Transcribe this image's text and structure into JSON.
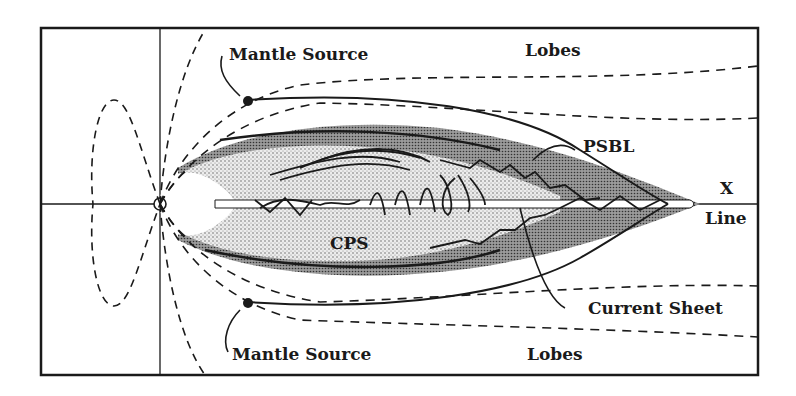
{
  "diagram": {
    "type": "magnetotail-schematic",
    "labels": {
      "mantle_source_top": "Mantle Source",
      "mantle_source_bottom": "Mantle Source",
      "lobes_top": "Lobes",
      "lobes_bottom": "Lobes",
      "psbl": "PSBL",
      "cps": "CPS",
      "x": "X",
      "line": "Line",
      "current_sheet": "Current Sheet"
    },
    "colors": {
      "ink": "#1a1a1a",
      "background": "#ffffff",
      "psbl_fill": "#8a8a8a",
      "cps_fill": "#d6d6d6"
    }
  }
}
